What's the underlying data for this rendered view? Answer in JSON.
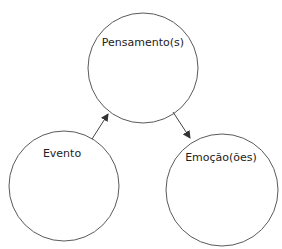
{
  "diagram": {
    "type": "flow-cycle",
    "colors": {
      "stroke": "#5a5a5a",
      "text": "#222222",
      "background": "#ffffff"
    },
    "nodes": [
      {
        "id": "pensamentos",
        "label": "Pensamento(s)",
        "cx": 143,
        "cy": 68,
        "r": 55,
        "label_x": 143,
        "label_y": 46
      },
      {
        "id": "evento",
        "label": "Evento",
        "cx": 64,
        "cy": 186,
        "r": 55,
        "label_x": 62,
        "label_y": 157
      },
      {
        "id": "emocoes",
        "label": "Emoção(ões)",
        "cx": 222,
        "cy": 190,
        "r": 56,
        "label_x": 221,
        "label_y": 161
      }
    ],
    "edges": [
      {
        "from": "evento",
        "to": "pensamentos",
        "x1": 92,
        "y1": 139,
        "x2": 108,
        "y2": 114
      },
      {
        "from": "pensamentos",
        "to": "emocoes",
        "x1": 173,
        "y1": 112,
        "x2": 190,
        "y2": 138
      }
    ]
  }
}
